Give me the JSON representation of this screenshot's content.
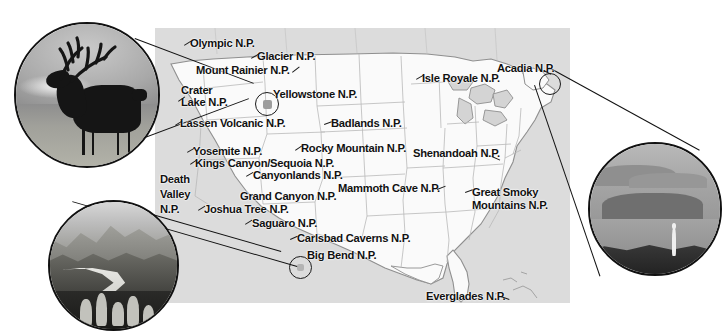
{
  "document": {
    "title": "United States National Parks Map",
    "type": "illustrated-map"
  },
  "map": {
    "name": "usa-national-parks-map",
    "ocean_color": "#dcdcdc",
    "land_color": "#fafafa",
    "border_color": "#9a9a9a",
    "label_color": "#111111"
  },
  "park_labels": [
    {
      "id": "olympic",
      "text": "Olympic N.P.",
      "x": 190,
      "y": 38,
      "tick": {
        "x": 183,
        "y": 44,
        "len": 8,
        "rot": -32
      }
    },
    {
      "id": "glacier",
      "text": "Glacier N.P.",
      "x": 257,
      "y": 51,
      "tick": {
        "x": 250,
        "y": 57,
        "len": 8,
        "rot": -30
      }
    },
    {
      "id": "mount-rainier",
      "text": "Mount Rainier N.P.",
      "x": 196,
      "y": 65,
      "tick": {
        "x": 291,
        "y": 72,
        "len": 9,
        "rot": -36
      }
    },
    {
      "id": "crater-lake",
      "text": "Crater\nLake N.P.",
      "x": 181,
      "y": 85,
      "tick": {
        "x": 178,
        "y": 100,
        "len": 8,
        "rot": -34
      }
    },
    {
      "id": "yellowstone",
      "text": "Yellowstone N.P.",
      "x": 273,
      "y": 89,
      "tick": null
    },
    {
      "id": "lassen",
      "text": "Lassen Volcanic N.P.",
      "x": 180,
      "y": 118,
      "tick": {
        "x": 175,
        "y": 124,
        "len": 8,
        "rot": -32
      }
    },
    {
      "id": "badlands",
      "text": "Badlands N.P.",
      "x": 331,
      "y": 118,
      "tick": {
        "x": 324,
        "y": 123,
        "len": 8,
        "rot": -20
      }
    },
    {
      "id": "yosemite",
      "text": "Yosemite N.P.",
      "x": 193,
      "y": 146,
      "tick": {
        "x": 187,
        "y": 151,
        "len": 8,
        "rot": -30
      }
    },
    {
      "id": "rocky-mountain",
      "text": "Rocky Mountain N.P.",
      "x": 301,
      "y": 143,
      "tick": {
        "x": 295,
        "y": 149,
        "len": 8,
        "rot": -34
      }
    },
    {
      "id": "shenandoah",
      "text": "Shenandoah N.P.",
      "x": 413,
      "y": 148,
      "tick": {
        "x": 492,
        "y": 155,
        "len": 9,
        "rot": -28
      }
    },
    {
      "id": "kings-sequoia",
      "text": "Kings Canyon/Sequoia N.P.",
      "x": 195,
      "y": 158,
      "tick": {
        "x": 190,
        "y": 164,
        "len": 8,
        "rot": -34
      }
    },
    {
      "id": "canyonlands",
      "text": "Canyonlands N.P.",
      "x": 253,
      "y": 170,
      "tick": {
        "x": 246,
        "y": 176,
        "len": 8,
        "rot": -30
      }
    },
    {
      "id": "mammoth-cave",
      "text": "Mammoth Cave N.P.",
      "x": 338,
      "y": 183,
      "tick": {
        "x": 438,
        "y": 186,
        "len": 9,
        "rot": 22
      }
    },
    {
      "id": "death-valley",
      "text": "Death\nValley\nN.P.",
      "x": 160,
      "y": 172,
      "tick": null
    },
    {
      "id": "grand-canyon",
      "text": "Grand Canyon N.P.",
      "x": 240,
      "y": 191,
      "tick": null
    },
    {
      "id": "great-smoky",
      "text": "Great Smoky\nMountains N.P.",
      "x": 472,
      "y": 186,
      "tick": {
        "x": 466,
        "y": 191,
        "len": 8,
        "rot": -20
      }
    },
    {
      "id": "joshua-tree",
      "text": "Joshua Tree N.P.",
      "x": 204,
      "y": 204,
      "tick": {
        "x": 198,
        "y": 209,
        "len": 8,
        "rot": -32
      }
    },
    {
      "id": "saguaro",
      "text": "Saguaro N.P.",
      "x": 252,
      "y": 218,
      "tick": {
        "x": 245,
        "y": 223,
        "len": 8,
        "rot": -32
      }
    },
    {
      "id": "carlsbad",
      "text": "Carlsbad Caverns N.P.",
      "x": 297,
      "y": 233,
      "tick": {
        "x": 290,
        "y": 238,
        "len": 8,
        "rot": -24
      }
    },
    {
      "id": "big-bend",
      "text": "Big Bend N.P.",
      "x": 307,
      "y": 250,
      "tick": null
    },
    {
      "id": "isle-royale",
      "text": "Isle Royale N.P.",
      "x": 422,
      "y": 73,
      "tick": {
        "x": 416,
        "y": 78,
        "len": 8,
        "rot": -30
      }
    },
    {
      "id": "acadia",
      "text": "Acadia N.P.",
      "x": 497,
      "y": 63,
      "tick": null
    },
    {
      "id": "everglades",
      "text": "Everglades N.P.",
      "x": 426,
      "y": 291,
      "tick": {
        "x": 500,
        "y": 294,
        "len": 9,
        "rot": 20
      }
    }
  ],
  "map_markers": [
    {
      "id": "marker-yellowstone",
      "x": 255,
      "y": 92,
      "d": 22
    },
    {
      "id": "marker-acadia",
      "x": 539,
      "y": 73,
      "d": 20
    },
    {
      "id": "marker-big-bend",
      "x": 289,
      "y": 256,
      "d": 21
    }
  ],
  "photos": [
    {
      "id": "photo-yellowstone-elk",
      "caption_subject": "bull elk silhouette in meadow at dawn",
      "park": "Yellowstone N.P.",
      "x": 14,
      "y": 22,
      "d": 146
    },
    {
      "id": "photo-big-bend-river",
      "caption_subject": "desert river canyon with prickly pear cactus",
      "park": "Big Bend N.P.",
      "x": 48,
      "y": 200,
      "d": 131
    },
    {
      "id": "photo-acadia-coast",
      "caption_subject": "foggy island coastline with lone figure on rocks",
      "park": "Acadia N.P.",
      "x": 588,
      "y": 142,
      "d": 134
    }
  ],
  "leaders": [
    {
      "id": "leader-elk-top",
      "x1": 135,
      "y1": 38,
      "x2": 252,
      "y2": 86
    },
    {
      "id": "leader-elk-bottom",
      "x1": 110,
      "y1": 150,
      "x2": 250,
      "y2": 98
    },
    {
      "id": "leader-acadia-top",
      "x1": 548,
      "y1": 66,
      "x2": 700,
      "y2": 150
    },
    {
      "id": "leader-acadia-bottom",
      "x1": 534,
      "y1": 84,
      "x2": 600,
      "y2": 276
    },
    {
      "id": "leader-bigbend-top",
      "x1": 281,
      "y1": 252,
      "x2": 106,
      "y2": 202
    },
    {
      "id": "leader-bigbend-bot",
      "x1": 296,
      "y1": 266,
      "x2": 72,
      "y2": 331
    }
  ]
}
